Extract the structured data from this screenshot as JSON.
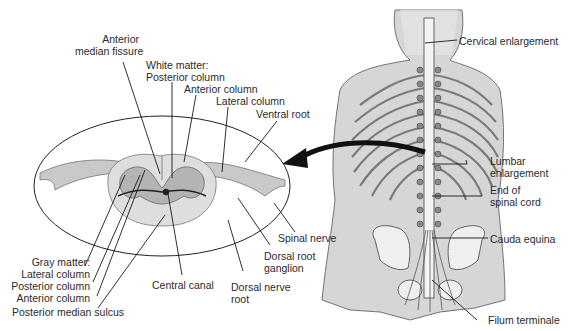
{
  "cross_section": {
    "labels": {
      "anterior_median_fissure": [
        "Anterior",
        "median fissure"
      ],
      "white_matter_title": "White matter:",
      "white_posterior_column": "Posterior column",
      "white_anterior_column": "Anterior column",
      "white_lateral_column": "Lateral column",
      "ventral_root": "Ventral root",
      "spinal_nerve": "Spinal nerve",
      "dorsal_root_ganglion": [
        "Dorsal root",
        "ganglion"
      ],
      "dorsal_nerve_root": [
        "Dorsal nerve",
        "root"
      ],
      "central_canal": "Central canal",
      "gray_matter_title": "Gray matter:",
      "gray_lateral_column": "Lateral column",
      "gray_posterior_column": "Posterior column",
      "gray_anterior_column": "Anterior column",
      "posterior_median_sulcus": "Posterior median sulcus"
    }
  },
  "body_view": {
    "labels": {
      "cervical_enlargement": "Cervical enlargement",
      "lumbar_enlargement": [
        "Lumbar",
        "enlargement"
      ],
      "end_of_spinal_cord": [
        "End of",
        "spinal cord"
      ],
      "cauda_equina": "Cauda equina",
      "filum_terminale": "Filum terminale"
    }
  },
  "colors": {
    "line": "#1a1a1a",
    "gray_matter": "#b8b8b8",
    "white_matter": "#dedede",
    "skin": "#cfcfcf",
    "bone": "#f0f0f0"
  }
}
